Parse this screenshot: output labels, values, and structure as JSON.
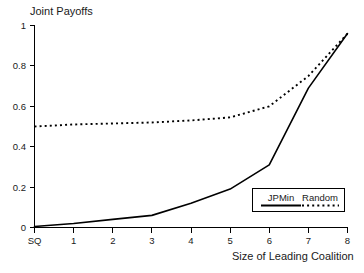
{
  "chart_data": {
    "type": "line",
    "title": "Joint Payoffs",
    "xlabel": "Size of Leading Coalition",
    "ylabel": "",
    "categories": [
      "SQ",
      "1",
      "2",
      "3",
      "4",
      "5",
      "6",
      "7",
      "8"
    ],
    "x_tick_labels": [
      "SQ",
      "1",
      "2",
      "3",
      "4",
      "5",
      "6",
      "7",
      "8"
    ],
    "y_tick_labels": [
      "0",
      "0.2",
      "0.4",
      "0.6",
      "0.8",
      "1"
    ],
    "y_tick_values": [
      0,
      0.2,
      0.4,
      0.6,
      0.8,
      1
    ],
    "ylim": [
      0,
      1
    ],
    "xlim": [
      0,
      8
    ],
    "grid": false,
    "legend_position": "inside-lower-right",
    "series": [
      {
        "name": "JPMin",
        "style": "solid",
        "color": "#000000",
        "values": [
          0.005,
          0.02,
          0.04,
          0.06,
          0.12,
          0.19,
          0.31,
          0.69,
          0.96
        ]
      },
      {
        "name": "Random",
        "style": "dotted",
        "color": "#000000",
        "values": [
          0.5,
          0.51,
          0.515,
          0.52,
          0.53,
          0.545,
          0.6,
          0.75,
          0.96
        ]
      }
    ]
  },
  "legend": {
    "entries": [
      {
        "label": "JPMin",
        "style": "solid"
      },
      {
        "label": "Random",
        "style": "dotted"
      }
    ]
  }
}
